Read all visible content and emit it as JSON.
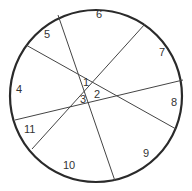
{
  "diagram": {
    "type": "circle-divided-by-lines",
    "circle": {
      "cx": 96,
      "cy": 96,
      "r": 86,
      "stroke": "#2a2a2a",
      "stroke_width": 2.2
    },
    "lines": [
      {
        "id": "line-a",
        "x1": 58,
        "y1": 15,
        "x2": 115,
        "y2": 181
      },
      {
        "id": "line-b",
        "x1": 26,
        "y1": 45,
        "x2": 176,
        "y2": 129
      },
      {
        "id": "line-c",
        "x1": 145,
        "y1": 24,
        "x2": 32,
        "y2": 149
      },
      {
        "id": "line-d",
        "x1": 15,
        "y1": 120,
        "x2": 183,
        "y2": 80
      }
    ],
    "line_color": "#444444",
    "regions": [
      {
        "label": "1",
        "x": 83,
        "y": 86
      },
      {
        "label": "2",
        "x": 94,
        "y": 98
      },
      {
        "label": "3",
        "x": 80,
        "y": 103
      },
      {
        "label": "4",
        "x": 16,
        "y": 93
      },
      {
        "label": "5",
        "x": 44,
        "y": 38
      },
      {
        "label": "6",
        "x": 96,
        "y": 18
      },
      {
        "label": "7",
        "x": 159,
        "y": 56
      },
      {
        "label": "8",
        "x": 171,
        "y": 106
      },
      {
        "label": "9",
        "x": 143,
        "y": 157
      },
      {
        "label": "10",
        "x": 63,
        "y": 169
      },
      {
        "label": "11",
        "x": 24,
        "y": 133
      }
    ]
  }
}
